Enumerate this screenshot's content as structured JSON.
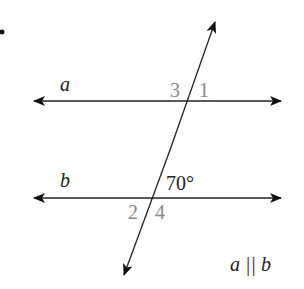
{
  "diagram": {
    "type": "parallel-lines-transversal",
    "lines": {
      "a": {
        "label": "a"
      },
      "b": {
        "label": "b"
      }
    },
    "angles": {
      "angle_3": "3",
      "angle_1": "1",
      "angle_2": "2",
      "angle_4": "4",
      "given_angle": "70°"
    },
    "condition": "a || b",
    "colors": {
      "line": "#222222",
      "angle_number": "#888888"
    }
  }
}
